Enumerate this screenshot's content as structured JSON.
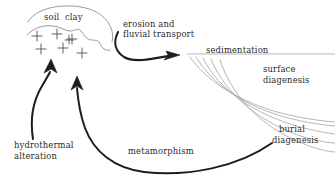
{
  "diagram": {
    "colors": {
      "ink": "#2b2b2b",
      "thin_line": "#8d8d8d",
      "basin_line": "#a9a9a9",
      "background": "#ffffff"
    },
    "labels": {
      "soil_clay": "soil  clay",
      "erosion_line1": "erosion and",
      "erosion_line2": "fluvial transport",
      "sedimentation": "sedimentation",
      "surface_line1": "surface",
      "surface_line2": "diagenesis",
      "burial_line1": "burial",
      "burial_line2": "diagenesis",
      "metamorphism": "metamorphism",
      "hydrothermal_line1": "hydrothermal",
      "hydrothermal_line2": "alteration"
    },
    "processes": [
      "erosion and fluvial transport",
      "sedimentation",
      "surface diagenesis",
      "burial diagenesis",
      "metamorphism",
      "hydrothermal alteration"
    ],
    "features": {
      "pluton_symbol": "plus-signs",
      "pluton_plus_count": 7,
      "basin_arc_count": 5
    }
  }
}
